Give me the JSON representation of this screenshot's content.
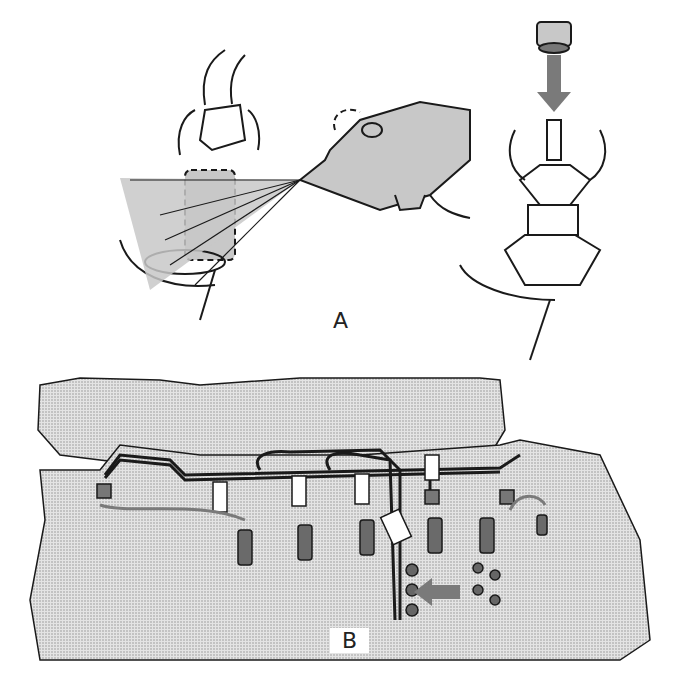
{
  "panels": [
    {
      "id": "A",
      "label": "A",
      "description": "Spraying fuel injector pipe union with aerosol; fitting protective cap to injector inlet"
    },
    {
      "id": "B",
      "label": "B",
      "description": "Engine with fuel injector pipe assembly being removed from injectors and injection pump"
    }
  ],
  "colors": {
    "line": "#1a1a1a",
    "fill_gray": "#c8c8c8",
    "stipple": "#d9d9d9",
    "arrow": "#7a7a7a",
    "background": "#ffffff"
  }
}
